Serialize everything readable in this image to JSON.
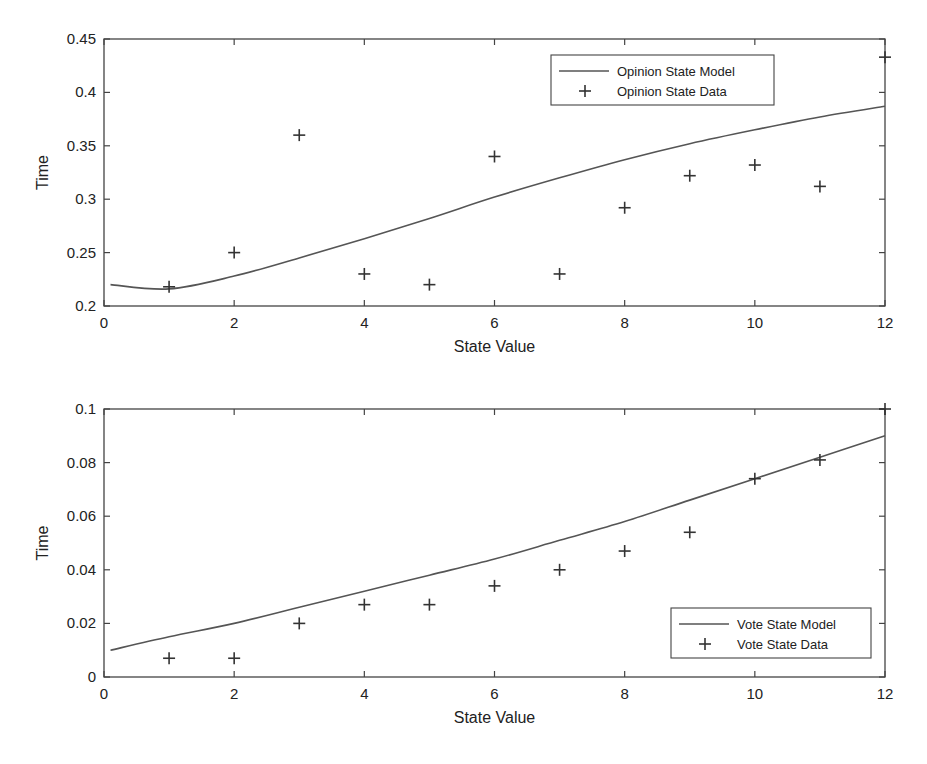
{
  "chart_data": [
    {
      "type": "line",
      "title": "",
      "xlabel": "State Value",
      "ylabel": "Time",
      "xlim": [
        0,
        12
      ],
      "ylim": [
        0.2,
        0.45
      ],
      "xticks": [
        "0",
        "2",
        "4",
        "6",
        "8",
        "10",
        "12"
      ],
      "yticks": [
        "0.2",
        "0.25",
        "0.3",
        "0.35",
        "0.4",
        "0.45"
      ],
      "grid": false,
      "legend_position": "upper right",
      "series": [
        {
          "name": "Opinion State Model",
          "style": "line",
          "x": [
            0.1,
            1,
            2,
            3,
            4,
            5,
            6,
            7,
            8,
            9,
            10,
            11,
            12
          ],
          "values": [
            0.22,
            0.216,
            0.228,
            0.245,
            0.263,
            0.282,
            0.302,
            0.32,
            0.337,
            0.352,
            0.365,
            0.377,
            0.387
          ]
        },
        {
          "name": "Opinion State Data",
          "style": "marker-plus",
          "x": [
            1,
            2,
            3,
            4,
            5,
            6,
            7,
            8,
            9,
            10,
            11,
            12
          ],
          "values": [
            0.218,
            0.25,
            0.36,
            0.23,
            0.22,
            0.34,
            0.23,
            0.292,
            0.322,
            0.332,
            0.312,
            0.433
          ]
        }
      ]
    },
    {
      "type": "line",
      "title": "",
      "xlabel": "State Value",
      "ylabel": "Time",
      "xlim": [
        0,
        12
      ],
      "ylim": [
        0,
        0.1
      ],
      "xticks": [
        "0",
        "2",
        "4",
        "6",
        "8",
        "10",
        "12"
      ],
      "yticks": [
        "0",
        "0.02",
        "0.04",
        "0.06",
        "0.08",
        "0.1"
      ],
      "grid": false,
      "legend_position": "lower right",
      "series": [
        {
          "name": "Vote State Model",
          "style": "line",
          "x": [
            0.1,
            1,
            2,
            3,
            4,
            5,
            6,
            7,
            8,
            9,
            10,
            11,
            12
          ],
          "values": [
            0.01,
            0.015,
            0.02,
            0.026,
            0.032,
            0.038,
            0.044,
            0.051,
            0.058,
            0.066,
            0.074,
            0.082,
            0.09
          ]
        },
        {
          "name": "Vote State Data",
          "style": "marker-plus",
          "x": [
            1,
            2,
            3,
            4,
            5,
            6,
            7,
            8,
            9,
            10,
            11,
            12
          ],
          "values": [
            0.007,
            0.007,
            0.02,
            0.027,
            0.027,
            0.034,
            0.04,
            0.047,
            0.054,
            0.074,
            0.081,
            0.1
          ]
        }
      ]
    }
  ]
}
